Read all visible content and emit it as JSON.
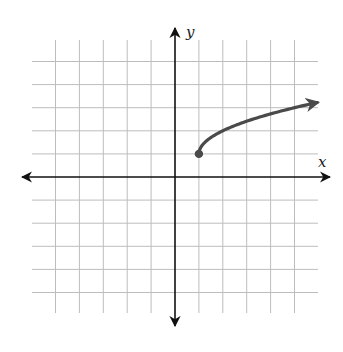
{
  "chart_data": {
    "type": "line",
    "title": "",
    "xlabel": "x",
    "ylabel": "y",
    "xlim": [
      -5,
      5
    ],
    "ylim": [
      -5,
      5
    ],
    "grid": true,
    "tick_labels": false,
    "function": "y = sqrt(x - 1) + 1",
    "series": [
      {
        "name": "radical function",
        "start_point": {
          "x": 1,
          "y": 1,
          "closed": true
        },
        "end_arrow": true,
        "x": [
          1,
          1.25,
          1.5,
          2,
          3,
          4,
          5,
          6
        ],
        "y": [
          1,
          1.5,
          1.71,
          2,
          2.41,
          2.73,
          3,
          3.24
        ]
      }
    ]
  },
  "labels": {
    "x_axis": "x",
    "y_axis": "y"
  },
  "colors": {
    "grid": "#bdbdbd",
    "axis": "#111111",
    "curve": "#4a4a4a",
    "background": "#ffffff"
  }
}
